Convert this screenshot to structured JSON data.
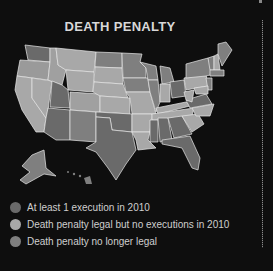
{
  "title": "DEATH PENALTY",
  "colors": {
    "background": "#0e0e0e",
    "executed": "#6a6a6a",
    "legal_no_exec": "#a8a8a8",
    "abolished": "#7f7f7f",
    "border": "#e8e8e8"
  },
  "legend": [
    {
      "label": "At least 1 execution in 2010",
      "color": "#6a6a6a"
    },
    {
      "label": "Death penalty legal but no executions in 2010",
      "color": "#a8a8a8"
    },
    {
      "label": "Death penalty no longer legal",
      "color": "#7f7f7f"
    }
  ]
}
